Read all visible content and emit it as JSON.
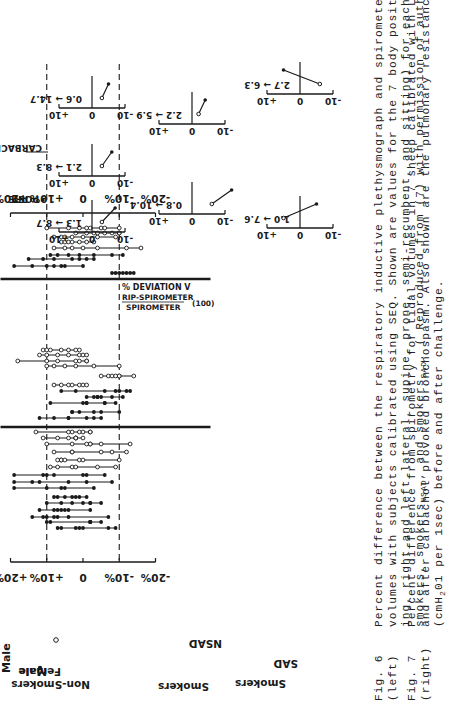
{
  "page": {
    "orientation": "rotated-90-ccw",
    "background": "#ffffff",
    "ink": "#1a1a1a"
  },
  "fig6": {
    "legend": {
      "male": "Male",
      "female": "Female"
    },
    "group_labels": {
      "non_smokers": "Non-Smokers",
      "smokers_nsad": "Smokers",
      "nsad": "NSAD",
      "smokers_sad": "Smokers",
      "sad": "SAD"
    },
    "axis_ticks": [
      "+20%",
      "+10%",
      "0",
      "-10%",
      "-20%"
    ]
  },
  "fig7": {
    "legend": {
      "pre": "PRE",
      "post": "POST",
      "condition": "CARBACHOL"
    },
    "ylabel_line1": "% DEVIATION V",
    "ylabel_sub": "T",
    "ylabel_num": "RIP-SPIROMETER",
    "ylabel_den": "SPIROMETER",
    "ylabel_factor": "(100)",
    "tick_plus": "+10",
    "tick_zero": "0",
    "tick_minus": "-10",
    "panels": [
      {
        "label": "1.3 → 8.7"
      },
      {
        "label": "2.1 → 8.3"
      },
      {
        "label": "0.6 → 14.7"
      },
      {
        "label": "0.8 → 10.4"
      },
      {
        "label": "2.2 → 5.9"
      },
      {
        "label": "1.0 → 7.6"
      },
      {
        "label": "2.7 → 6.3"
      }
    ]
  },
  "captions": {
    "fig6": {
      "label1": "Fig. 6",
      "label2": "(left)",
      "lines": [
        "Percent difference between the respiratory inductive plethysmograph and spirometer for tidal",
        "volumes  with  subjects calibrated using SEQ.  Shown are values for the 7 body positions (stand-",
        "ing, right and left lateral, supine, prone, semi-recumbent, and sitting) for each of the non-",
        "smokers, smokers",
        "NSAD",
        ", and smokers",
        "SAD",
        ".  ( Reproduced from (7) with permission of authors)."
      ]
    },
    "fig7": {
      "label1": "Fig. 7",
      "label2": "(right)",
      "lines": [
        "Percent difference from spirometry for tidal volumes in 7 sheep calibrated  with LSQ both before",
        "and after carbachol provoked bronchospasm.  Also   shown are the pulmonary resistance values",
        "(cmH",
        "2",
        "01 per 1sec) before and after challenge."
      ]
    }
  },
  "chart_data": [
    {
      "type": "range-dot",
      "title": "Fig. 6 Percent difference RIP vs spirometer (SEQ calibration), 7 body positions per subject",
      "xlabel": "Subjects (grouped)",
      "ylabel": "% difference",
      "ylim": [
        -20,
        20
      ],
      "reference_lines": [
        10,
        -10
      ],
      "groups": [
        "Non-Smokers",
        "Smokers NSAD",
        "Smokers SAD"
      ],
      "legend": [
        {
          "name": "Male",
          "marker": "filled"
        },
        {
          "name": "Female",
          "marker": "open"
        }
      ],
      "series": [
        {
          "group": "Non-Smokers",
          "sex": "M",
          "values": [
            7,
            6,
            2,
            1,
            0,
            -7,
            -9
          ]
        },
        {
          "group": "Non-Smokers",
          "sex": "M",
          "values": [
            10,
            9,
            -2,
            -2,
            -2,
            -2,
            -5
          ]
        },
        {
          "group": "Non-Smokers",
          "sex": "M",
          "values": [
            14,
            11,
            10,
            8,
            7,
            4,
            -7
          ]
        },
        {
          "group": "Non-Smokers",
          "sex": "M",
          "values": [
            12,
            8,
            7,
            6,
            5,
            4,
            -2
          ]
        },
        {
          "group": "Non-Smokers",
          "sex": "M",
          "values": [
            10,
            6,
            3,
            0,
            -2,
            -2,
            -5
          ]
        },
        {
          "group": "Non-Smokers",
          "sex": "M",
          "values": [
            8,
            7,
            5,
            3,
            2,
            1,
            -1
          ]
        },
        {
          "group": "Non-Smokers",
          "sex": "M",
          "values": [
            19,
            10,
            6,
            5,
            -3
          ]
        },
        {
          "group": "Non-Smokers",
          "sex": "M",
          "values": [
            19,
            14,
            12,
            4,
            -1,
            -8
          ]
        },
        {
          "group": "Non-Smokers",
          "sex": "M",
          "values": [
            19,
            11,
            10,
            8,
            0,
            -1,
            -6
          ]
        },
        {
          "group": "Non-Smokers",
          "sex": "F",
          "values": [
            9,
            7,
            3,
            2,
            -4,
            -9
          ]
        },
        {
          "group": "Non-Smokers",
          "sex": "F",
          "values": [
            7,
            6,
            6,
            5,
            1,
            0,
            -10
          ]
        },
        {
          "group": "Non-Smokers",
          "sex": "F",
          "values": [
            8,
            3,
            3,
            -5,
            -8,
            -12
          ]
        },
        {
          "group": "Non-Smokers",
          "sex": "F",
          "values": [
            10,
            3,
            -1,
            -2,
            -2,
            -5,
            -13
          ]
        },
        {
          "group": "Non-Smokers",
          "sex": "F",
          "values": [
            11,
            7,
            4,
            2,
            2,
            2,
            0
          ]
        },
        {
          "group": "Non-Smokers",
          "sex": "F",
          "values": [
            13,
            4,
            3,
            1,
            0,
            -2,
            -2
          ]
        },
        {
          "group": "Smokers NSAD",
          "sex": "M",
          "values": [
            12,
            8,
            4,
            4,
            -1,
            -3,
            -5
          ]
        },
        {
          "group": "Smokers NSAD",
          "sex": "M",
          "values": [
            3,
            3,
            1,
            -3,
            -5,
            -10
          ]
        },
        {
          "group": "Smokers NSAD",
          "sex": "M",
          "values": [
            9,
            0,
            -1,
            -1,
            -6,
            -6,
            -9
          ]
        },
        {
          "group": "Smokers NSAD",
          "sex": "M",
          "values": [
            -1,
            -3,
            -4,
            -4,
            -5,
            -8,
            -11
          ]
        },
        {
          "group": "Smokers NSAD",
          "sex": "M",
          "values": [
            6,
            2,
            -6,
            -9,
            -10,
            -12,
            -13
          ]
        },
        {
          "group": "Smokers NSAD",
          "sex": "F",
          "values": [
            8,
            6,
            4,
            3,
            1,
            0,
            -1
          ]
        },
        {
          "group": "Smokers NSAD",
          "sex": "F",
          "values": [
            -5,
            -7,
            -8,
            -9,
            -10,
            -10,
            -14
          ]
        },
        {
          "group": "Smokers NSAD",
          "sex": "F",
          "values": [
            10,
            8,
            5,
            2,
            -3,
            -10
          ]
        },
        {
          "group": "Smokers NSAD",
          "sex": "F",
          "values": [
            18,
            10,
            7,
            2,
            1,
            -1,
            -1
          ]
        },
        {
          "group": "Smokers NSAD",
          "sex": "F",
          "values": [
            12,
            10,
            7,
            4,
            1,
            0,
            -1
          ]
        },
        {
          "group": "Smokers NSAD",
          "sex": "F",
          "values": [
            11,
            10,
            9,
            6,
            4,
            2,
            1
          ]
        },
        {
          "group": "Smokers SAD",
          "sex": "M",
          "values": [
            -8,
            -9,
            -10,
            -11,
            -12,
            -13,
            -14
          ]
        },
        {
          "group": "Smokers SAD",
          "sex": "M",
          "values": [
            19,
            14,
            10,
            8,
            6,
            5,
            0
          ]
        },
        {
          "group": "Smokers SAD",
          "sex": "M",
          "values": [
            15,
            11,
            8,
            3,
            1,
            -1,
            -3
          ]
        },
        {
          "group": "Smokers SAD",
          "sex": "M",
          "values": [
            9,
            7,
            4,
            1,
            -3,
            -8,
            -11
          ]
        },
        {
          "group": "Smokers SAD",
          "sex": "F",
          "values": [
            8,
            5,
            3,
            0,
            -4,
            -12,
            -16
          ]
        },
        {
          "group": "Smokers SAD",
          "sex": "F",
          "values": [
            6,
            5,
            4,
            3,
            1,
            -1,
            -3
          ]
        },
        {
          "group": "Smokers SAD",
          "sex": "F",
          "values": [
            8,
            6,
            5,
            3,
            0,
            -4,
            -9
          ]
        },
        {
          "group": "Smokers SAD",
          "sex": "F",
          "values": [
            2,
            -1,
            -3,
            -4,
            -6,
            -8,
            -10,
            -10
          ]
        },
        {
          "group": "Smokers SAD",
          "sex": "F",
          "values": [
            10,
            4,
            1,
            -1,
            -2,
            -5,
            -6,
            -10
          ]
        }
      ]
    },
    {
      "type": "line",
      "title": "Fig. 7 % deviation VT (RIP-Spirometer)/Spirometer x100, pre vs post carbachol, 7 sheep",
      "ylabel": "% DEVIATION VT",
      "ylim": [
        -10,
        10
      ],
      "categories": [
        "PRE",
        "POST"
      ],
      "series": [
        {
          "name": "Sheep 1",
          "resistance": "1.3 → 8.7",
          "values": [
            -3,
            -7
          ]
        },
        {
          "name": "Sheep 2",
          "resistance": "2.1 → 8.3",
          "values": [
            -3,
            -6
          ]
        },
        {
          "name": "Sheep 3",
          "resistance": "0.6 → 14.7",
          "values": [
            -3,
            -5
          ]
        },
        {
          "name": "Sheep 4",
          "resistance": "0.8 → 10.4",
          "values": [
            -6,
            -12
          ]
        },
        {
          "name": "Sheep 5",
          "resistance": "2.2 → 5.9",
          "values": [
            -2,
            -4
          ]
        },
        {
          "name": "Sheep 6",
          "resistance": "1.0 → 7.6",
          "values": [
            5,
            -5
          ]
        },
        {
          "name": "Sheep 7",
          "resistance": "2.7 → 6.3",
          "values": [
            -6,
            5
          ]
        }
      ]
    }
  ]
}
